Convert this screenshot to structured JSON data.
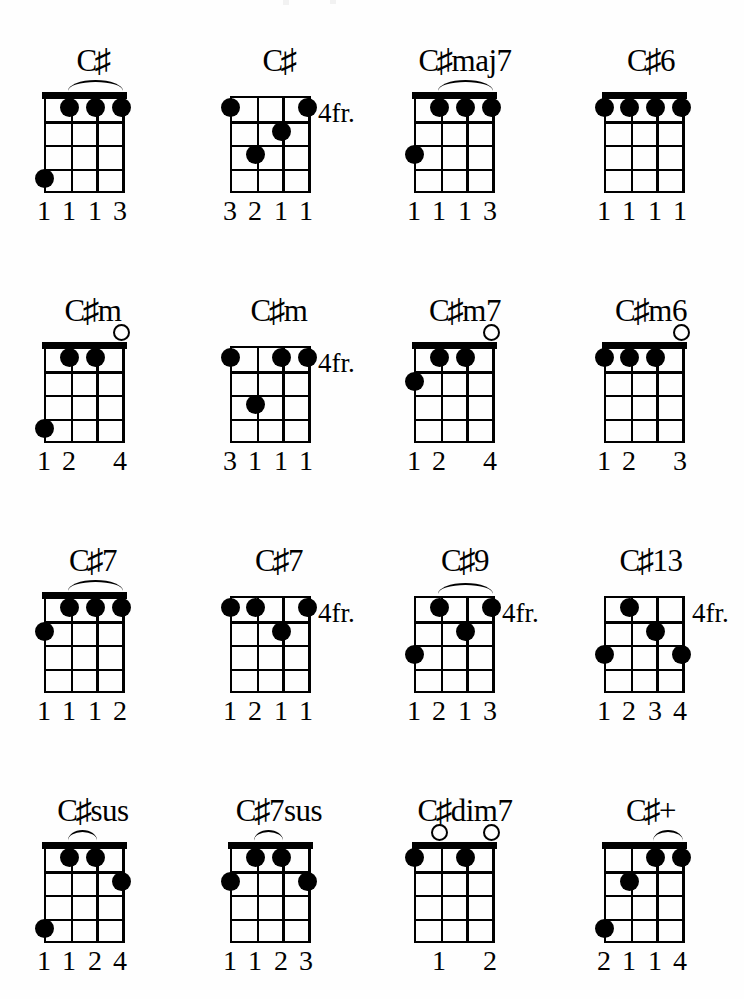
{
  "page": {
    "instrument": "ukulele",
    "strings": 4,
    "frets": 4,
    "ink_color": "#000000",
    "paper_color": "#ffffff"
  },
  "chords": [
    {
      "name": "C#",
      "name_root": "C",
      "name_accidental": "♯",
      "name_suffix": "",
      "position_label": "",
      "show_nut": true,
      "barre": {
        "from_string": 1,
        "to_string": 3,
        "fret": 1
      },
      "dots": [
        {
          "string": 1,
          "fret": 1
        },
        {
          "string": 2,
          "fret": 1
        },
        {
          "string": 3,
          "fret": 1
        },
        {
          "string": 4,
          "fret": 4
        }
      ],
      "open_strings": [],
      "fingers": [
        "1",
        "1",
        "1",
        "3"
      ]
    },
    {
      "name": "C#",
      "name_root": "C",
      "name_accidental": "♯",
      "name_suffix": "",
      "position_label": "4fr.",
      "show_nut": false,
      "barre": {
        "from_string": 3,
        "to_string": 4,
        "fret": 1
      },
      "dots": [
        {
          "string": 1,
          "fret": 3
        },
        {
          "string": 2,
          "fret": 2
        },
        {
          "string": 3,
          "fret": 1
        },
        {
          "string": 4,
          "fret": 1
        }
      ],
      "open_strings": [],
      "fingers": [
        "3",
        "2",
        "1",
        "1"
      ]
    },
    {
      "name": "C#maj7",
      "name_root": "C",
      "name_accidental": "♯",
      "name_suffix": "maj7",
      "position_label": "",
      "show_nut": true,
      "barre": {
        "from_string": 1,
        "to_string": 3,
        "fret": 1
      },
      "dots": [
        {
          "string": 1,
          "fret": 1
        },
        {
          "string": 2,
          "fret": 1
        },
        {
          "string": 3,
          "fret": 1
        },
        {
          "string": 4,
          "fret": 3
        }
      ],
      "open_strings": [],
      "fingers": [
        "1",
        "1",
        "1",
        "3"
      ]
    },
    {
      "name": "C#6",
      "name_root": "C",
      "name_accidental": "♯",
      "name_suffix": "6",
      "position_label": "",
      "show_nut": true,
      "barre": {
        "from_string": 1,
        "to_string": 4,
        "fret": 1
      },
      "dots": [
        {
          "string": 1,
          "fret": 1
        },
        {
          "string": 2,
          "fret": 1
        },
        {
          "string": 3,
          "fret": 1
        },
        {
          "string": 4,
          "fret": 1
        }
      ],
      "open_strings": [],
      "fingers": [
        "1",
        "1",
        "1",
        "1"
      ]
    },
    {
      "name": "C#m",
      "name_root": "C",
      "name_accidental": "♯",
      "name_suffix": "m",
      "position_label": "",
      "show_nut": true,
      "barre": null,
      "dots": [
        {
          "string": 1,
          "fret": 1
        },
        {
          "string": 2,
          "fret": 1
        },
        {
          "string": 4,
          "fret": 4
        }
      ],
      "open_strings": [
        3
      ],
      "fingers": [
        "1",
        "2",
        "",
        "4"
      ]
    },
    {
      "name": "C#m",
      "name_root": "C",
      "name_accidental": "♯",
      "name_suffix": "m",
      "position_label": "4fr.",
      "show_nut": false,
      "barre": {
        "from_string": 2,
        "to_string": 4,
        "fret": 1
      },
      "dots": [
        {
          "string": 1,
          "fret": 3
        },
        {
          "string": 2,
          "fret": 1
        },
        {
          "string": 3,
          "fret": 1
        },
        {
          "string": 4,
          "fret": 1
        }
      ],
      "open_strings": [],
      "fingers": [
        "3",
        "1",
        "1",
        "1"
      ]
    },
    {
      "name": "C#m7",
      "name_root": "C",
      "name_accidental": "♯",
      "name_suffix": "m7",
      "position_label": "",
      "show_nut": true,
      "barre": null,
      "dots": [
        {
          "string": 1,
          "fret": 1
        },
        {
          "string": 2,
          "fret": 1
        },
        {
          "string": 4,
          "fret": 2
        }
      ],
      "open_strings": [
        3
      ],
      "fingers": [
        "1",
        "2",
        "",
        "4"
      ]
    },
    {
      "name": "C#m6",
      "name_root": "C",
      "name_accidental": "♯",
      "name_suffix": "m6",
      "position_label": "",
      "show_nut": true,
      "barre": null,
      "dots": [
        {
          "string": 1,
          "fret": 1
        },
        {
          "string": 2,
          "fret": 1
        },
        {
          "string": 4,
          "fret": 1
        }
      ],
      "open_strings": [
        3
      ],
      "fingers": [
        "1",
        "2",
        "",
        "3"
      ]
    },
    {
      "name": "C#7",
      "name_root": "C",
      "name_accidental": "♯",
      "name_suffix": "7",
      "position_label": "",
      "show_nut": true,
      "barre": {
        "from_string": 1,
        "to_string": 3,
        "fret": 1
      },
      "dots": [
        {
          "string": 1,
          "fret": 1
        },
        {
          "string": 2,
          "fret": 1
        },
        {
          "string": 3,
          "fret": 1
        },
        {
          "string": 4,
          "fret": 2
        }
      ],
      "open_strings": [],
      "fingers": [
        "1",
        "1",
        "1",
        "2"
      ]
    },
    {
      "name": "C#7",
      "name_root": "C",
      "name_accidental": "♯",
      "name_suffix": "7",
      "position_label": "4fr.",
      "show_nut": false,
      "barre": {
        "from_string": 1,
        "to_string": 4,
        "fret": 1
      },
      "dots": [
        {
          "string": 1,
          "fret": 1
        },
        {
          "string": 2,
          "fret": 2
        },
        {
          "string": 3,
          "fret": 1
        },
        {
          "string": 4,
          "fret": 1
        }
      ],
      "open_strings": [],
      "fingers": [
        "1",
        "2",
        "1",
        "1"
      ]
    },
    {
      "name": "C#9",
      "name_root": "C",
      "name_accidental": "♯",
      "name_suffix": "9",
      "position_label": "4fr.",
      "show_nut": false,
      "barre": {
        "from_string": 1,
        "to_string": 3,
        "fret": 1
      },
      "dots": [
        {
          "string": 1,
          "fret": 1
        },
        {
          "string": 2,
          "fret": 2
        },
        {
          "string": 3,
          "fret": 1
        },
        {
          "string": 4,
          "fret": 3
        }
      ],
      "open_strings": [],
      "fingers": [
        "1",
        "2",
        "1",
        "3"
      ]
    },
    {
      "name": "C#13",
      "name_root": "C",
      "name_accidental": "♯",
      "name_suffix": "13",
      "position_label": "4fr.",
      "show_nut": false,
      "barre": null,
      "dots": [
        {
          "string": 1,
          "fret": 1
        },
        {
          "string": 2,
          "fret": 2
        },
        {
          "string": 3,
          "fret": 3
        },
        {
          "string": 4,
          "fret": 3
        }
      ],
      "open_strings": [],
      "fingers": [
        "1",
        "2",
        "3",
        "4"
      ]
    },
    {
      "name": "C#sus",
      "name_root": "C",
      "name_accidental": "♯",
      "name_suffix": "sus",
      "position_label": "",
      "show_nut": true,
      "barre": {
        "from_string": 1,
        "to_string": 2,
        "fret": 1
      },
      "dots": [
        {
          "string": 1,
          "fret": 1
        },
        {
          "string": 2,
          "fret": 1
        },
        {
          "string": 3,
          "fret": 2
        },
        {
          "string": 4,
          "fret": 4
        }
      ],
      "open_strings": [],
      "fingers": [
        "1",
        "1",
        "2",
        "4"
      ]
    },
    {
      "name": "C#7sus",
      "name_root": "C",
      "name_accidental": "♯",
      "name_suffix": "7sus",
      "position_label": "",
      "show_nut": true,
      "barre": {
        "from_string": 1,
        "to_string": 2,
        "fret": 1
      },
      "dots": [
        {
          "string": 1,
          "fret": 1
        },
        {
          "string": 2,
          "fret": 1
        },
        {
          "string": 3,
          "fret": 2
        },
        {
          "string": 4,
          "fret": 2
        }
      ],
      "open_strings": [],
      "fingers": [
        "1",
        "1",
        "2",
        "3"
      ]
    },
    {
      "name": "C#dim7",
      "name_root": "C",
      "name_accidental": "♯",
      "name_suffix": "dim7",
      "position_label": "",
      "show_nut": true,
      "barre": null,
      "dots": [
        {
          "string": 2,
          "fret": 1
        },
        {
          "string": 4,
          "fret": 1
        }
      ],
      "open_strings": [
        1,
        3
      ],
      "fingers": [
        "",
        "1",
        "",
        "2"
      ]
    },
    {
      "name": "C#+",
      "name_root": "C",
      "name_accidental": "♯",
      "name_suffix": "+",
      "position_label": "",
      "show_nut": true,
      "barre": {
        "from_string": 2,
        "to_string": 3,
        "fret": 1
      },
      "dots": [
        {
          "string": 1,
          "fret": 2
        },
        {
          "string": 2,
          "fret": 1
        },
        {
          "string": 3,
          "fret": 1
        },
        {
          "string": 4,
          "fret": 4
        }
      ],
      "open_strings": [],
      "fingers": [
        "2",
        "1",
        "1",
        "4"
      ]
    }
  ]
}
